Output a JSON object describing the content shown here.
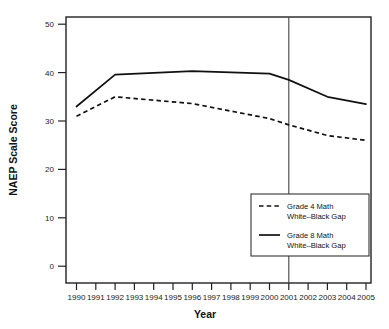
{
  "chart_data": {
    "type": "line",
    "title": "",
    "xlabel": "Year",
    "ylabel": "NAEP Scale Score",
    "x": [
      1990,
      1992,
      1996,
      2000,
      2003,
      2005
    ],
    "xlim": [
      1990,
      2005
    ],
    "ylim": [
      0,
      52
    ],
    "yticks": [
      0,
      10,
      20,
      30,
      40,
      50
    ],
    "xticks": [
      1990,
      1991,
      1992,
      1993,
      1994,
      1995,
      1996,
      1997,
      1998,
      1999,
      2000,
      2001,
      2002,
      2003,
      2004,
      2005
    ],
    "grid": false,
    "legend_position": "lower right",
    "annotations": [
      {
        "type": "vertical-line",
        "x": 2001,
        "label": ""
      }
    ],
    "series": [
      {
        "name": "Grade 4 Math White–Black Gap",
        "style": "dashed",
        "color": "#111111",
        "points": [
          {
            "x": 1990,
            "y": 31.0
          },
          {
            "x": 1992,
            "y": 35.0
          },
          {
            "x": 1996,
            "y": 33.6
          },
          {
            "x": 2000,
            "y": 30.5
          },
          {
            "x": 2001,
            "y": 29.2
          },
          {
            "x": 2003,
            "y": 27.0
          },
          {
            "x": 2005,
            "y": 26.0
          }
        ]
      },
      {
        "name": "Grade 8 Math White–Black Gap",
        "style": "solid",
        "color": "#111111",
        "points": [
          {
            "x": 1990,
            "y": 33.0
          },
          {
            "x": 1992,
            "y": 39.6
          },
          {
            "x": 1996,
            "y": 40.3
          },
          {
            "x": 2000,
            "y": 39.8
          },
          {
            "x": 2001,
            "y": 38.5
          },
          {
            "x": 2003,
            "y": 35.0
          },
          {
            "x": 2005,
            "y": 33.5
          }
        ]
      }
    ]
  },
  "axes": {
    "x_title": "Year",
    "y_title": "NAEP Scale Score",
    "y_tick_labels": [
      "50",
      "40",
      "30",
      "20",
      "10",
      "0"
    ],
    "x_tick_labels": [
      "1990",
      "1991",
      "1992",
      "1993",
      "1994",
      "1995",
      "1996",
      "1997",
      "1998",
      "1999",
      "2000",
      "2001",
      "2002",
      "2003",
      "2004",
      "2005"
    ]
  },
  "legend": {
    "entries": [
      {
        "style": "dashed",
        "line1": "Grade 4 Math",
        "line2": "White–Black Gap"
      },
      {
        "style": "solid",
        "line1": "Grade 8 Math",
        "line2": "White–Black Gap"
      }
    ]
  },
  "colors": {
    "line": "#111111",
    "frame": "#222222",
    "reference_line": "#444444",
    "background": "#ffffff"
  }
}
